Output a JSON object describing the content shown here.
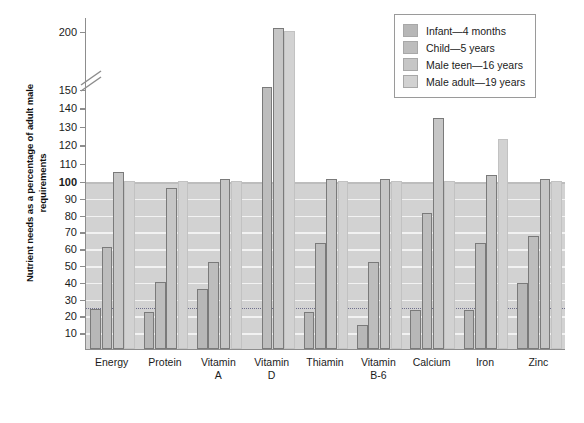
{
  "chart_data": {
    "type": "bar",
    "title": "",
    "xlabel": "",
    "ylabel": "Nutrient needs as a percentage of adult male requirements",
    "ylim": [
      0,
      210
    ],
    "grid": true,
    "legend_position": "top-right",
    "axis_break": {
      "between": [
        150,
        200
      ],
      "note": "broken y-axis between 150 and 200"
    },
    "reference_lines": [
      {
        "value": 100,
        "style": "solid-bold",
        "label": "100"
      },
      {
        "value": 25,
        "style": "dotted"
      }
    ],
    "y_ticks": [
      10,
      20,
      30,
      40,
      50,
      60,
      70,
      80,
      90,
      100,
      110,
      120,
      130,
      140,
      150,
      200
    ],
    "categories": [
      "Energy",
      "Protein",
      "Vitamin A",
      "Vitamin D",
      "Thiamin",
      "Vitamin B-6",
      "Calcium",
      "Iron",
      "Zinc"
    ],
    "category_lines": [
      [
        "Energy",
        ""
      ],
      [
        "Protein",
        ""
      ],
      [
        "Vitamin",
        "A"
      ],
      [
        "Vitamin",
        "D"
      ],
      [
        "Thiamin",
        ""
      ],
      [
        "Vitamin",
        "B-6"
      ],
      [
        "Calcium",
        ""
      ],
      [
        "Iron",
        ""
      ],
      [
        "Zinc",
        ""
      ]
    ],
    "series": [
      {
        "name": "Infant—4 months",
        "color": "#b7b7b7",
        "values": [
          24,
          22,
          36,
          null,
          22,
          14,
          23,
          23,
          39
        ]
      },
      {
        "name": "Child—5 years",
        "color": "#bdbdbd",
        "values": [
          61,
          40,
          52,
          152,
          63,
          52,
          81,
          63,
          67
        ]
      },
      {
        "name": "Male teen—16 years",
        "color": "#c6c6c6",
        "values": [
          105,
          96,
          101,
          203,
          101,
          101,
          134,
          103,
          101
        ]
      },
      {
        "name": "Male adult—19 years",
        "color": "#d2d2d2",
        "values": [
          100,
          100,
          100,
          200,
          100,
          100,
          100,
          123,
          100
        ]
      }
    ]
  },
  "legend": {
    "items": [
      "Infant—4 months",
      "Child—5 years",
      "Male teen—16 years",
      "Male adult—19 years"
    ]
  }
}
